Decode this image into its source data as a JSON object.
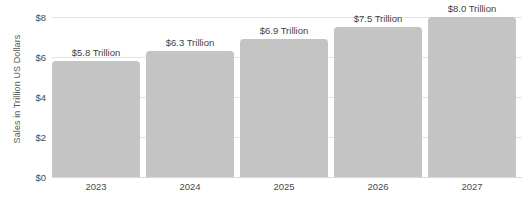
{
  "chart_data": {
    "type": "bar",
    "title": "",
    "subtitle": "",
    "xlabel": "",
    "ylabel": "Sales in Trillion US Dollars",
    "categories": [
      "2023",
      "2024",
      "2025",
      "2026",
      "2027"
    ],
    "values": [
      5.8,
      6.3,
      6.9,
      7.5,
      8.0
    ],
    "data_labels": [
      "$5.8 Trillion",
      "$6.3 Trillion",
      "$6.9 Trillion",
      "$7.5 Trillion",
      "$8.0 Trillion"
    ],
    "ylim": [
      0,
      8
    ],
    "y_ticks": [
      0,
      2,
      4,
      6,
      8
    ],
    "y_tick_labels": [
      "$0",
      "$2",
      "$4",
      "$6",
      "$8"
    ],
    "grid": true,
    "grid_axis": "y",
    "legend": false,
    "legend_position": "none",
    "series": [
      {
        "name": "Sales",
        "values": [
          5.8,
          6.3,
          6.9,
          7.5,
          8.0
        ],
        "color": "#c4c4c4"
      }
    ],
    "colors": {
      "bar": "#c4c4c4",
      "gridline": "#e3e3e3",
      "axis_text": "#4a4a4a",
      "label_text": "#3f3f3f",
      "background": "#ffffff"
    }
  }
}
